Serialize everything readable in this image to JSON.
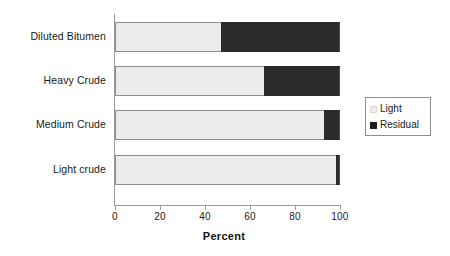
{
  "chart_data": {
    "type": "bar",
    "orientation": "horizontal",
    "stacked": true,
    "title": "",
    "xlabel": "Percent",
    "ylabel": "",
    "xlim": [
      0,
      100
    ],
    "xticks": [
      0,
      20,
      40,
      60,
      80,
      100
    ],
    "xtick_labels": [
      "0",
      "20",
      "40",
      "60",
      "80",
      "100"
    ],
    "grid": false,
    "legend_position": "right",
    "categories": [
      "Diluted Bitumen",
      "Heavy Crude",
      "Medium Crude",
      "Light crude"
    ],
    "series": [
      {
        "name": "Light",
        "color": "#ececec",
        "values": [
          47,
          66,
          93,
          98
        ]
      },
      {
        "name": "Residual",
        "color": "#2b2b2b",
        "values": [
          53,
          34,
          7,
          2
        ]
      }
    ]
  },
  "legend": {
    "items": [
      {
        "label": "Light",
        "swatch": "light-swatch"
      },
      {
        "label": "Residual",
        "swatch": "residual-swatch"
      }
    ]
  },
  "axis": {
    "x_title": "Percent",
    "tick_labels": [
      "0",
      "20",
      "40",
      "60",
      "80",
      "100"
    ]
  },
  "categories": {
    "labels": [
      "Diluted Bitumen",
      "Heavy Crude",
      "Medium Crude",
      "Light crude"
    ]
  },
  "colors": {
    "light": "#ececec",
    "residual": "#2b2b2b",
    "axis": "#9a9a9a",
    "text": "#1a1a1a",
    "background": "#ffffff"
  }
}
